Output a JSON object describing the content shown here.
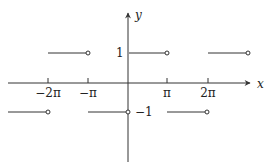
{
  "figure": {
    "type": "step_function_plot",
    "axes": {
      "x_label": "x",
      "y_label": "y",
      "x_ticks": [
        {
          "label": "−2π",
          "value": -6.2832
        },
        {
          "label": "−π",
          "value": -3.1416
        },
        {
          "label": "π",
          "value": 3.1416
        },
        {
          "label": "2π",
          "value": 6.2832
        }
      ],
      "y_ticks": [
        {
          "label": "1",
          "value": 1
        },
        {
          "label": "−1",
          "value": -1
        }
      ]
    },
    "segments": [
      {
        "y": 1,
        "x_start": "-2π",
        "x_end": "-π",
        "open_end": true
      },
      {
        "y": 1,
        "x_start": "0",
        "x_end": "π",
        "open_end": true
      },
      {
        "y": 1,
        "x_start": "2π",
        "x_end": "3π",
        "open_end": true
      },
      {
        "y": -1,
        "x_start": "-3π",
        "x_end": "-2π",
        "open_end": true
      },
      {
        "y": -1,
        "x_start": "-π",
        "x_end": "0",
        "open_end": true
      },
      {
        "y": -1,
        "x_start": "π",
        "x_end": "2π",
        "open_end": true
      }
    ],
    "colors": {
      "line": "#333333",
      "background": "#ffffff"
    }
  }
}
